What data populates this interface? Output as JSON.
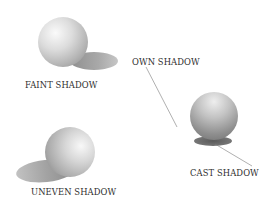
{
  "diagram": {
    "title": "",
    "labels": {
      "faint_shadow": "FAINT SHADOW",
      "uneven_shadow": "UNEVEN SHADOW",
      "own_shadow": "OWN SHADOW",
      "cast_shadow": "CAST SHADOW"
    },
    "elements": [
      {
        "id": "sphere-faint",
        "label": "FAINT SHADOW",
        "shadow_direction": "right"
      },
      {
        "id": "sphere-uneven",
        "label": "UNEVEN SHADOW",
        "shadow_direction": "left"
      },
      {
        "id": "sphere-own-cast",
        "labels": [
          "OWN SHADOW",
          "CAST SHADOW"
        ],
        "shadow_direction": "below"
      }
    ],
    "colors": {
      "background": "#ffffff",
      "sphere_highlight": "#f7f7f7",
      "sphere_mid": "#c9c9c9",
      "sphere_dark": "#8a8a8a",
      "shadow_light": "#b9b9b9",
      "shadow_dark": "#6e6e6e",
      "leader_line": "#7a7a7a",
      "text": "#2e2e2e"
    }
  }
}
